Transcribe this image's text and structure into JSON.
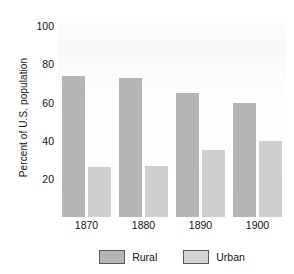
{
  "chart_data": {
    "type": "bar",
    "title": "",
    "subtitle": "",
    "xlabel": "",
    "ylabel": "Percent of U.S. population",
    "categories": [
      "1870",
      "1880",
      "1890",
      "1900"
    ],
    "series": [
      {
        "name": "Rural",
        "values": [
          74,
          73,
          65,
          60
        ],
        "color": "#b5b5b5"
      },
      {
        "name": "Urban",
        "values": [
          26,
          27,
          35,
          40
        ],
        "color": "#cfcfcf"
      }
    ],
    "ylim": [
      0,
      100
    ],
    "yticks": [
      20,
      40,
      60,
      80,
      100
    ],
    "ytick_labels": [
      "20",
      "40",
      "60",
      "80",
      "100"
    ],
    "grid": false,
    "legend_position": "bottom"
  },
  "axis": {
    "y_title": "Percent of U.S. population",
    "y_ticks": [
      {
        "label": "100",
        "value": 100
      },
      {
        "label": "80",
        "value": 80
      },
      {
        "label": "60",
        "value": 60
      },
      {
        "label": "40",
        "value": 40
      },
      {
        "label": "20",
        "value": 20
      }
    ],
    "x_ticks": [
      {
        "label": "1870"
      },
      {
        "label": "1880"
      },
      {
        "label": "1890"
      },
      {
        "label": "1900"
      }
    ]
  },
  "legend": {
    "items": [
      {
        "label": "Rural",
        "swatch_color": "#b5b5b5"
      },
      {
        "label": "Urban",
        "swatch_color": "#d4d4d4"
      }
    ]
  },
  "artifacts": {
    "top_clipped_text": "y"
  }
}
